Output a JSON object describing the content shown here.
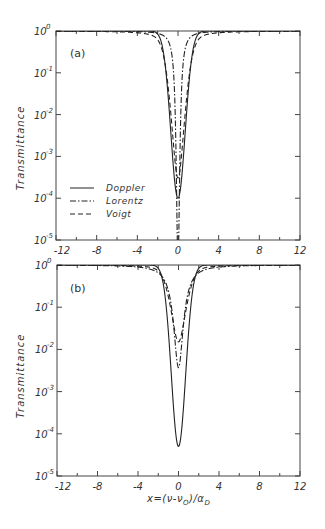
{
  "chart_data": [
    {
      "type": "line",
      "panel": "(a)",
      "xlabel": "x=(ν-ν0)/αD",
      "ylabel": "Transmittance",
      "xlim": [
        -12,
        12
      ],
      "ylim": [
        1e-05,
        1
      ],
      "yscale": "log",
      "xticks": [
        -12,
        -8,
        -4,
        0,
        4,
        8,
        12
      ],
      "yticks": [
        "10^0",
        "10^-1",
        "10^-2",
        "10^-3",
        "10^-4",
        "10^-5"
      ],
      "legend": [
        "Doppler",
        "Lorentz",
        "Voigt"
      ],
      "legend_position": "lower left",
      "series": [
        {
          "name": "Doppler",
          "style": "solid",
          "profile": "doppler",
          "depth": 9.21,
          "width": 1.0,
          "min_value": 0.0001
        },
        {
          "name": "Lorentz",
          "style": "dashdot",
          "profile": "lorentz",
          "depth": 13.0,
          "width": 0.35,
          "min_value": 2e-06
        },
        {
          "name": "Voigt",
          "style": "dashed",
          "profile": "voigt",
          "depth": 8.1,
          "width": 1.05,
          "min_value": 0.0003
        }
      ]
    },
    {
      "type": "line",
      "panel": "(b)",
      "xlabel": "x=(ν-ν0)/αD",
      "ylabel": "Transmittance",
      "xlim": [
        -12,
        12
      ],
      "ylim": [
        1e-05,
        1
      ],
      "yscale": "log",
      "xticks": [
        -12,
        -8,
        -4,
        0,
        4,
        8,
        12
      ],
      "yticks": [
        "10^0",
        "10^-1",
        "10^-2",
        "10^-3",
        "10^-4",
        "10^-5"
      ],
      "series": [
        {
          "name": "Doppler",
          "style": "solid",
          "profile": "doppler",
          "depth": 9.9,
          "width": 1.0,
          "min_value": 5e-05
        },
        {
          "name": "Lorentz",
          "style": "dashdot",
          "profile": "lorentz",
          "depth": 5.6,
          "width": 1.0,
          "min_value": 0.0038
        },
        {
          "name": "Voigt",
          "style": "dashed",
          "profile": "voigt",
          "depth": 4.2,
          "width": 1.15,
          "min_value": 0.015
        }
      ]
    }
  ],
  "labels": {
    "panel_a": "(a)",
    "panel_b": "(b)",
    "ylabel": "Transmittance",
    "xlabel": "x=(ν-ν",
    "xlabel_sub0": "O",
    "xlabel_mid": ")/α",
    "xlabel_subD": "D",
    "legend": [
      "Doppler",
      "Lorentz",
      "Voigt"
    ],
    "xtick_labels": [
      "-12",
      "-8",
      "-4",
      "0",
      "4",
      "8",
      "12"
    ],
    "ytick_base": "10",
    "ytick_exps": [
      "0",
      "-1",
      "-2",
      "-3",
      "-4",
      "-5"
    ]
  }
}
